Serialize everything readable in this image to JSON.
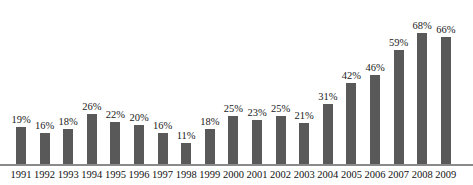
{
  "chart_data": {
    "type": "bar",
    "title": "",
    "subtitle": "",
    "xlabel": "",
    "ylabel": "",
    "grid": false,
    "legend": "none",
    "ylim": [
      0,
      70
    ],
    "value_suffix": "%",
    "categories": [
      "1991",
      "1992",
      "1993",
      "1994",
      "1995",
      "1996",
      "1997",
      "1998",
      "1999",
      "2000",
      "2001",
      "2002",
      "2003",
      "2004",
      "2005",
      "2006",
      "2007",
      "2008",
      "2009"
    ],
    "values": [
      19,
      16,
      18,
      26,
      22,
      20,
      16,
      11,
      18,
      25,
      23,
      25,
      21,
      31,
      42,
      46,
      59,
      68,
      66
    ],
    "data_labels": [
      "19%",
      "16%",
      "18%",
      "26%",
      "22%",
      "20%",
      "16%",
      "11%",
      "18%",
      "25%",
      "23%",
      "25%",
      "21%",
      "31%",
      "42%",
      "46%",
      "59%",
      "68%",
      "66%"
    ],
    "series": [
      {
        "name": "",
        "color": "#595959",
        "values": [
          19,
          16,
          18,
          26,
          22,
          20,
          16,
          11,
          18,
          25,
          23,
          25,
          21,
          31,
          42,
          46,
          59,
          68,
          66
        ]
      }
    ]
  },
  "style": {
    "bar_color": "#595959",
    "axis_color": "#8a8a8a",
    "label_color": "#1a1a1a",
    "background": "#ffffff"
  }
}
